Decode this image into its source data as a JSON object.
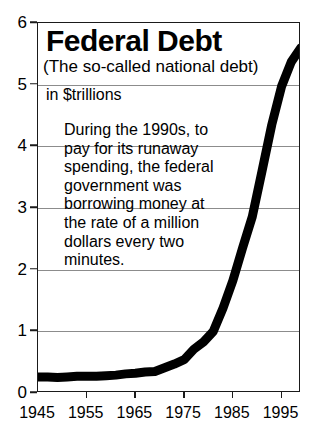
{
  "chart_data": {
    "type": "line",
    "title": "Federal Debt",
    "subtitle": "(The so-called national debt)",
    "unit_label": "in $trillions",
    "xlabel": "",
    "ylabel": "",
    "xlim": [
      1945,
      1999
    ],
    "ylim": [
      0,
      6
    ],
    "grid": true,
    "legend": "none",
    "x_ticks": [
      1945,
      1955,
      1965,
      1975,
      1985,
      1995
    ],
    "y_ticks": [
      0,
      1,
      2,
      3,
      4,
      5,
      6
    ],
    "annotation": [
      "During the 1990s, to",
      "pay for its runaway",
      "spending, the federal",
      "government was",
      "borrowing money at",
      "the rate of a million",
      "dollars every two",
      "minutes."
    ],
    "series": [
      {
        "name": "Federal Debt",
        "color": "#000000",
        "x": [
          1945,
          1947,
          1949,
          1951,
          1953,
          1955,
          1957,
          1959,
          1961,
          1963,
          1965,
          1967,
          1969,
          1971,
          1973,
          1975,
          1977,
          1979,
          1981,
          1983,
          1985,
          1987,
          1989,
          1991,
          1993,
          1995,
          1997,
          1999
        ],
        "values": [
          0.26,
          0.26,
          0.25,
          0.26,
          0.27,
          0.27,
          0.27,
          0.28,
          0.29,
          0.31,
          0.32,
          0.34,
          0.35,
          0.41,
          0.47,
          0.54,
          0.71,
          0.83,
          1.0,
          1.38,
          1.82,
          2.35,
          2.86,
          3.6,
          4.35,
          4.97,
          5.37,
          5.6
        ]
      }
    ]
  }
}
